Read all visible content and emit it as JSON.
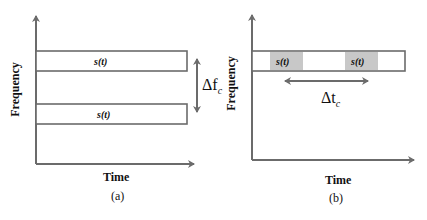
{
  "panel_a": {
    "label": "(a)",
    "x_axis_label": "Time",
    "y_axis_label": "Frequency",
    "signals": [
      {
        "label": "s(t)"
      },
      {
        "label": "s(t)"
      }
    ],
    "annotation": {
      "symbol": "Δf",
      "subscript": "c"
    }
  },
  "panel_b": {
    "label": "(b)",
    "x_axis_label": "Time",
    "y_axis_label": "Frequency",
    "signals": [
      {
        "label": "s(t)"
      },
      {
        "label": "s(t)"
      }
    ],
    "annotation": {
      "symbol": "Δt",
      "subscript": "c"
    }
  },
  "colors": {
    "line": "#6b6b6b",
    "shade": "#c8c8c8"
  }
}
